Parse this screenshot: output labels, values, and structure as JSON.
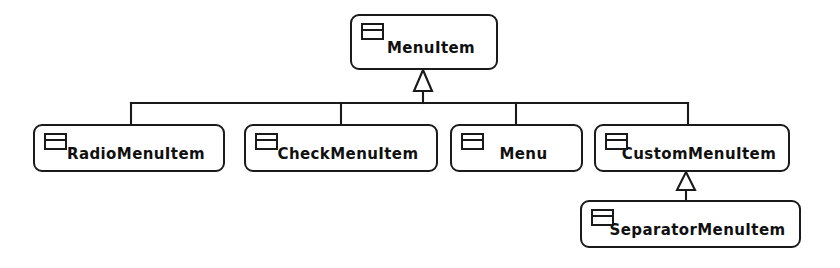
{
  "diagram": {
    "type": "uml-class-inheritance",
    "background_color": "#ffffff",
    "line_color": "#1a1a1a",
    "nodes": [
      {
        "id": "menuitem",
        "label": "MenuItem",
        "icon": "uml-class-icon",
        "x": 350,
        "y": 14,
        "w": 148,
        "h": 56
      },
      {
        "id": "radiomenuitem",
        "label": "RadioMenuItem",
        "icon": "uml-class-icon",
        "x": 33,
        "y": 124,
        "w": 192,
        "h": 48
      },
      {
        "id": "checkmenuitem",
        "label": "CheckMenuItem",
        "icon": "uml-class-icon",
        "x": 244,
        "y": 124,
        "w": 194,
        "h": 48
      },
      {
        "id": "menu",
        "label": "Menu",
        "icon": "uml-class-icon",
        "x": 450,
        "y": 124,
        "w": 133,
        "h": 48
      },
      {
        "id": "custommenuitem",
        "label": "CustomMenuItem",
        "icon": "uml-class-icon",
        "x": 594,
        "y": 124,
        "w": 196,
        "h": 48
      },
      {
        "id": "separatormenuitem",
        "label": "SeparatorMenuItem",
        "icon": "uml-class-icon",
        "x": 580,
        "y": 200,
        "w": 221,
        "h": 48
      }
    ],
    "edges": [
      {
        "from": "radiomenuitem",
        "to": "menuitem",
        "relation": "generalization"
      },
      {
        "from": "checkmenuitem",
        "to": "menuitem",
        "relation": "generalization"
      },
      {
        "from": "menu",
        "to": "menuitem",
        "relation": "generalization"
      },
      {
        "from": "custommenuitem",
        "to": "menuitem",
        "relation": "generalization"
      },
      {
        "from": "separatormenuitem",
        "to": "custommenuitem",
        "relation": "generalization"
      }
    ]
  }
}
